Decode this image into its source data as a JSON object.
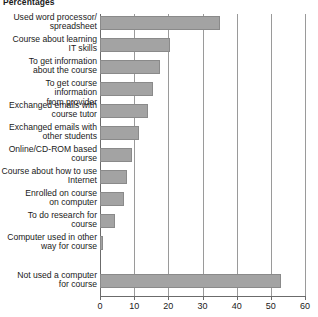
{
  "chart_data": {
    "type": "bar",
    "orientation": "horizontal",
    "title": "Percentages",
    "xlabel": "",
    "ylabel": "",
    "xlim": [
      0,
      60
    ],
    "xticks": [
      0,
      10,
      20,
      30,
      40,
      50,
      60
    ],
    "xtick_labels": [
      "0",
      "10",
      "20",
      "30",
      "40",
      "50",
      "60"
    ],
    "grid": true,
    "grid_axis": "x",
    "legend": false,
    "bar_color": "#a3a3a3",
    "bar_edge_color": "#8a8a8a",
    "axis_color": "#6b6b6b",
    "categories": [
      "Used word processor/\nspreadsheet",
      "Course about learning\nIT skills",
      "To get information\nabout the course",
      "To get course information\nfrom provider",
      "Exchanged emails with\ncourse tutor",
      "Exchanged emails with\nother students",
      "Online/CD-ROM based\ncourse",
      "Course about how to use\nInternet",
      "Enrolled on course\non computer",
      "To do research for\ncourse",
      "Computer used in other\nway for course",
      "Not used a computer\nfor course"
    ],
    "values": [
      35,
      20.5,
      17.5,
      15.5,
      14,
      11.5,
      9.5,
      8,
      7,
      4.5,
      1,
      53
    ]
  }
}
